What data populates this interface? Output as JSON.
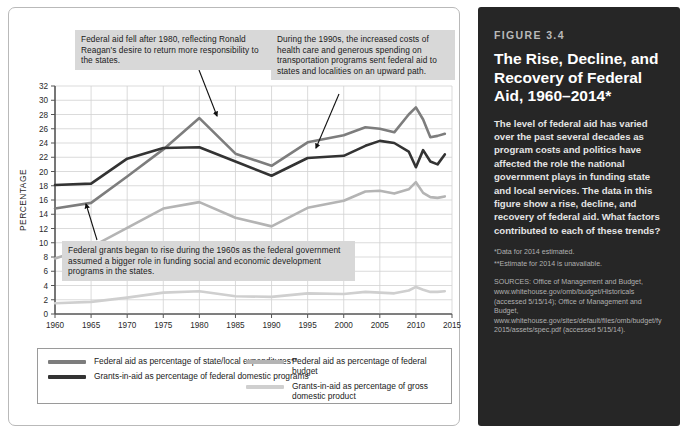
{
  "figure": {
    "number": "FIGURE 3.4",
    "title": "The Rise, Decline, and Recovery of Federal Aid, 1960–2014*",
    "body": "The level of federal aid has varied over the past several decades as program costs and politics have affected the role the national government plays in funding state and local services. The data in this figure show a rise, decline, and recovery of federal aid. What factors contributed to each of these trends?",
    "note1": "*Data for 2014 estimated.",
    "note2": "**Estimate for 2014 is unavailable.",
    "sources": "SOURCES: Office of Management and Budget, www.whitehouse.gov/omb/budget/Historicals (accessed 5/15/14); Office of Management and Budget, www.whitehouse.gov/sites/default/files/omb/budget/fy2015/assets/spec.pdf (accessed 5/15/14)."
  },
  "annotations": [
    {
      "id": "reagan",
      "text": "Federal aid fell after 1980, reflecting Ronald Reagan's desire to return more responsibility to the states."
    },
    {
      "id": "nineties",
      "text": "During the 1990s, the increased costs of health care and generous spending on transportation programs sent federal aid to states and localities on an upward path."
    },
    {
      "id": "grants",
      "text": "Federal grants began to rise during the 1960s as the federal government assumed a bigger role in funding social and economic development programs in the states."
    }
  ],
  "chart_data": {
    "type": "line",
    "title": "",
    "xlabel": "",
    "ylabel": "PERCENTAGE",
    "xlim": [
      1960,
      2015
    ],
    "ylim": [
      0,
      32
    ],
    "ytick_step": 2,
    "xtick_step": 5,
    "grid": true,
    "legend_position": "bottom",
    "xticks": [
      "1960",
      "1965",
      "1970",
      "1975",
      "1980",
      "1985",
      "1990",
      "1995",
      "2000",
      "2005",
      "2010",
      "2015"
    ],
    "yticks": [
      "0",
      "2",
      "4",
      "6",
      "8",
      "10",
      "12",
      "14",
      "16",
      "18",
      "20",
      "22",
      "24",
      "26",
      "28",
      "30",
      "32"
    ],
    "x": [
      1960,
      1965,
      1970,
      1975,
      1980,
      1985,
      1990,
      1995,
      2000,
      2003,
      2005,
      2007,
      2009,
      2010,
      2011,
      2012,
      2013,
      2014
    ],
    "series": [
      {
        "name": "Federal aid as percentage of state/local expenditures**",
        "key": "state_local",
        "color": "#7d7d7d",
        "values": [
          14.8,
          15.6,
          19.3,
          23.1,
          27.5,
          22.5,
          20.8,
          24.1,
          25.1,
          26.2,
          26.0,
          25.5,
          28.0,
          29.0,
          27.3,
          24.8,
          25.0,
          25.3
        ]
      },
      {
        "name": "Grants-in-aid as percentage of federal domestic programs",
        "key": "federal_domestic",
        "color": "#333333",
        "values": [
          18.1,
          18.3,
          21.8,
          23.3,
          23.4,
          21.4,
          19.4,
          21.9,
          22.2,
          23.6,
          24.3,
          24.0,
          22.8,
          20.6,
          23.0,
          21.4,
          21.0,
          22.4
        ]
      },
      {
        "name": "Federal aid as percentage of federal budget",
        "key": "federal_budget",
        "color": "#b4b4b4",
        "values": [
          7.8,
          9.4,
          12.1,
          14.8,
          15.7,
          13.5,
          12.3,
          14.9,
          15.9,
          17.2,
          17.3,
          16.9,
          17.5,
          18.5,
          17.0,
          16.4,
          16.3,
          16.5
        ]
      },
      {
        "name": "Grants-in-aid as percentage of gross domestic product",
        "key": "gdp",
        "color": "#cfcfcf",
        "values": [
          1.5,
          1.7,
          2.3,
          3.0,
          3.2,
          2.5,
          2.4,
          2.9,
          2.8,
          3.1,
          3.0,
          2.9,
          3.3,
          3.8,
          3.4,
          3.1,
          3.1,
          3.2
        ]
      }
    ]
  },
  "legend": {
    "items": [
      {
        "label": "Federal aid as percentage of state/local expenditures**",
        "color": "#7d7d7d",
        "col": "left"
      },
      {
        "label": "Grants-in-aid as percentage of federal domestic programs",
        "color": "#333333",
        "col": "left"
      },
      {
        "label": "Federal aid as percentage of federal budget",
        "color": "#b4b4b4",
        "col": "right"
      },
      {
        "label": "Grants-in-aid as percentage of gross domestic product",
        "color": "#cfcfcf",
        "col": "right"
      }
    ]
  }
}
